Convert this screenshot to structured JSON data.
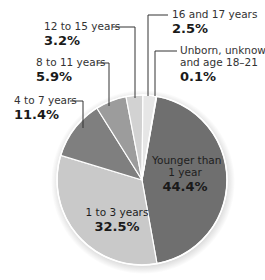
{
  "chart_data": {
    "type": "pie",
    "title": "",
    "start_angle_deg": 10,
    "direction": "clockwise",
    "slices": [
      {
        "label": "Younger than 1 year",
        "value": 44.4,
        "display": "44.4%",
        "color": "#6f6f6f"
      },
      {
        "label": "1 to 3 years",
        "value": 32.5,
        "display": "32.5%",
        "color": "#c9c9c9"
      },
      {
        "label": "4 to 7 years",
        "value": 11.4,
        "display": "11.4%",
        "color": "#7f7f7f"
      },
      {
        "label": "8 to 11 years",
        "value": 5.9,
        "display": "5.9%",
        "color": "#9c9c9c"
      },
      {
        "label": "12 to 15 years",
        "value": 3.2,
        "display": "3.2%",
        "color": "#d2d2d2"
      },
      {
        "label": "16 and 17 years",
        "value": 2.5,
        "display": "2.5%",
        "color": "#e6e6e6"
      },
      {
        "label": "Unborn, unknown, and age 18–21",
        "value": 0.1,
        "display": "0.1%",
        "color": "#f4f4f4"
      }
    ],
    "unit": "%",
    "legend": "none (direct labels with leader lines)"
  },
  "labels": {
    "younger": {
      "line1": "Younger than",
      "line2": "1 year",
      "pct": "44.4%"
    },
    "one_to_three": {
      "cat": "1 to 3 years",
      "pct": "32.5%"
    },
    "four_to_seven": {
      "cat": "4 to 7 years",
      "pct": "11.4%"
    },
    "eight_to_eleven": {
      "cat": "8 to 11 years",
      "pct": "5.9%"
    },
    "twelve_to_fifteen": {
      "cat": "12 to 15 years",
      "pct": "3.2%"
    },
    "sixteen_seventeen": {
      "cat": "16 and 17 years",
      "pct": "2.5%"
    },
    "unborn": {
      "line1": "Unborn, unknown,",
      "line2": "and age 18–21",
      "pct": "0.1%"
    }
  }
}
